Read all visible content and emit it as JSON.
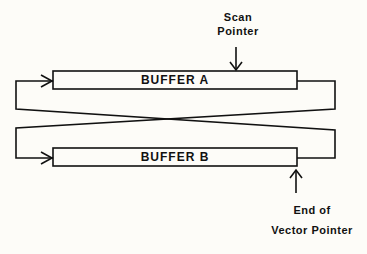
{
  "diagram": {
    "buffers": [
      {
        "id": "A",
        "label": "BUFFER   A"
      },
      {
        "id": "B",
        "label": "BUFFER   B"
      }
    ],
    "pointers": {
      "scan": {
        "line1": "Scan",
        "line2": "Pointer",
        "target": "BUFFER A"
      },
      "end_of_vector": {
        "line1": "End of",
        "line2": "Vector Pointer",
        "target": "BUFFER B"
      }
    },
    "connections": [
      {
        "from": "BUFFER A (right end)",
        "to": "BUFFER B (left end)",
        "style": "crossed loop"
      },
      {
        "from": "BUFFER B (right end)",
        "to": "BUFFER A (left end)",
        "style": "crossed loop"
      }
    ],
    "colors": {
      "line": "#111111",
      "background": "#fdfcf8"
    }
  }
}
